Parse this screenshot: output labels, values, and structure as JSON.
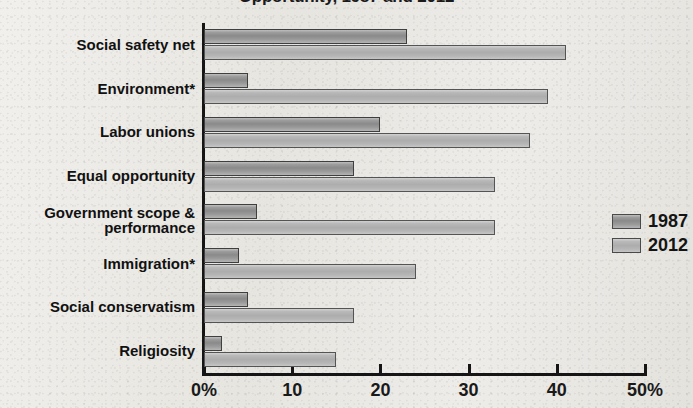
{
  "chart_data": {
    "type": "bar",
    "orientation": "horizontal",
    "title": "Opportunity, 1987 and 2012",
    "xlabel": "",
    "ylabel": "",
    "xlim": [
      0,
      50
    ],
    "xticks": [
      0,
      10,
      20,
      30,
      40,
      50
    ],
    "xticklabels": [
      "0%",
      "10",
      "20",
      "30",
      "40",
      "50%"
    ],
    "grid": false,
    "legend_position": "right",
    "categories": [
      "Social safety net",
      "Environment*",
      "Labor unions",
      "Equal opportunity",
      "Government scope &\nperformance",
      "Immigration*",
      "Social conservatism",
      "Religiosity"
    ],
    "series": [
      {
        "name": "1987",
        "color": "#9a9a9a",
        "values": [
          23,
          5,
          20,
          17,
          6,
          4,
          5,
          2
        ]
      },
      {
        "name": "2012",
        "color": "#b8b8b8",
        "values": [
          41,
          39,
          37,
          33,
          33,
          24,
          17,
          15
        ]
      }
    ]
  },
  "legend": {
    "items": [
      {
        "label": "1987"
      },
      {
        "label": "2012"
      }
    ]
  }
}
